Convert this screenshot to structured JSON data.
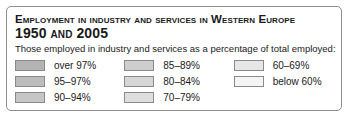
{
  "panel": {
    "title_line1": "Employment in industry and services in Western Europe",
    "title_line2": "1950 and 2005",
    "subtitle": "Those employed in industry and services as a percentage of total employed:",
    "border_color": "#8e8e8e",
    "background_color": "#ffffff",
    "text_color": "#1a1a1a"
  },
  "chart_data": {
    "type": "table",
    "title": "Employment in industry and services in Western Europe 1950 and 2005",
    "subtitle": "Those employed in industry and services as a percentage of total employed:",
    "legend_position": "panel",
    "columns": [
      {
        "items": [
          {
            "label": "over 97%",
            "color": "#b4b4b4"
          },
          {
            "label": "95–97%",
            "color": "#bcbcbc"
          },
          {
            "label": "90–94%",
            "color": "#c6c6c6"
          }
        ]
      },
      {
        "items": [
          {
            "label": "85–89%",
            "color": "#cecece"
          },
          {
            "label": "80–84%",
            "color": "#d6d6d6"
          },
          {
            "label": "70–79%",
            "color": "#dedede"
          }
        ]
      },
      {
        "items": [
          {
            "label": "60–69%",
            "color": "#e6e6e6"
          },
          {
            "label": "below 60%",
            "color": "#f4f4f4"
          }
        ]
      }
    ]
  }
}
